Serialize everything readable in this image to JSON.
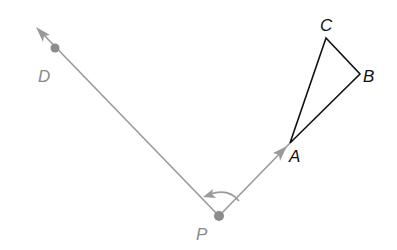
{
  "diagram": {
    "title": "",
    "colors": {
      "ray": "#9a9a9a",
      "point": "#8c8c8c",
      "triangle": "#111111",
      "label_gray": "#8a8a8a",
      "label_black": "#111111"
    },
    "points": {
      "D": {
        "label": "D",
        "x": 55,
        "y": 48
      },
      "P": {
        "label": "P",
        "x": 219,
        "y": 216
      },
      "A": {
        "label": "A",
        "x": 290,
        "y": 143
      },
      "B": {
        "label": "B",
        "x": 360,
        "y": 74
      },
      "C": {
        "label": "C",
        "x": 326,
        "y": 38
      }
    },
    "rays": [
      {
        "name": "ray-PD",
        "from": "P",
        "through": "D",
        "arrow": true
      },
      {
        "name": "ray-PA",
        "from": "P",
        "through": "A",
        "arrow": true
      }
    ],
    "triangle": [
      "A",
      "B",
      "C"
    ],
    "rotation_arc": {
      "center": "P",
      "direction": "counterclockwise"
    }
  }
}
